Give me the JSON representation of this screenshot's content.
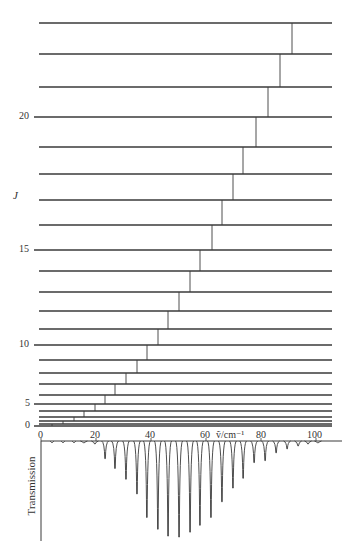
{
  "figure": {
    "type": "rotational-energy-levels-and-absorption-spectrum",
    "level_axis_label": "J",
    "level_tick_labels": [
      {
        "J": 0,
        "text": "0"
      },
      {
        "J": 5,
        "text": "5"
      },
      {
        "J": 10,
        "text": "10"
      },
      {
        "J": 15,
        "text": "15"
      },
      {
        "J": 20,
        "text": "20"
      }
    ],
    "spectrum_axis": {
      "label": "ṽ/cm⁻¹",
      "ticks": [
        "0",
        "20",
        "40",
        "60",
        "80",
        "100"
      ],
      "tick_values": [
        0,
        20,
        40,
        60,
        80,
        100
      ]
    },
    "spectrum_ylabel": "Transmission",
    "colors": {
      "line": "#3a3a3a",
      "text": "#333333",
      "background": "#ffffff"
    }
  },
  "chart_data": {
    "type": "line",
    "title": "",
    "xlabel": "ṽ/cm⁻¹",
    "ylabel": "Transmission",
    "xlim": [
      0,
      107
    ],
    "levels": {
      "J": [
        0,
        1,
        2,
        3,
        4,
        5,
        6,
        7,
        8,
        9,
        10,
        11,
        12,
        13,
        14,
        15,
        16,
        17,
        18,
        19,
        20,
        21,
        22,
        23
      ],
      "y_px": [
        426,
        424,
        421,
        417,
        411,
        404,
        395,
        384,
        373,
        360,
        345,
        329,
        311,
        292,
        271,
        250,
        225,
        200,
        174,
        147,
        117,
        87,
        54,
        23
      ]
    },
    "transitions_px_x": [
      52,
      63,
      74,
      84,
      95,
      105,
      115,
      126,
      137,
      147,
      158,
      168,
      179,
      190,
      200,
      212,
      222,
      233,
      243,
      256,
      268,
      280,
      292
    ],
    "absorption_lines": {
      "wavenumber": [
        4.0,
        8.0,
        12.0,
        15.6,
        19.6,
        23.3,
        26.9,
        30.9,
        34.9,
        38.5,
        42.5,
        46.2,
        50.2,
        54.2,
        57.8,
        61.8,
        65.8,
        69.8,
        73.5,
        77.5,
        81.5,
        85.5,
        89.5,
        93.5,
        97.1,
        100.7
      ],
      "relative_depth": [
        0.0,
        0.0,
        0.01,
        0.02,
        0.03,
        0.18,
        0.28,
        0.39,
        0.54,
        0.78,
        0.9,
        0.97,
        0.98,
        0.93,
        0.86,
        0.78,
        0.62,
        0.48,
        0.38,
        0.22,
        0.2,
        0.12,
        0.08,
        0.05,
        0.03,
        0.02
      ]
    }
  }
}
